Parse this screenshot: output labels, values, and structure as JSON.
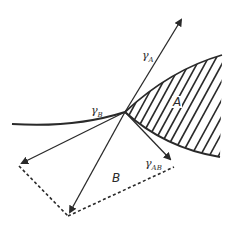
{
  "diagram": {
    "type": "surface-tension-vector-balance",
    "colors": {
      "ink": "#2a2a2a",
      "background": "#ffffff"
    },
    "labels": {
      "gamma_a": {
        "symbol": "γ",
        "sub": "A"
      },
      "gamma_b": {
        "symbol": "γ",
        "sub": "B"
      },
      "gamma_ab": {
        "symbol": "γ",
        "sub": "AB"
      },
      "region_a": "A",
      "region_b": "B"
    },
    "points": {
      "junction": [
        125,
        112
      ],
      "gamma_a_tip": [
        183,
        16
      ],
      "gamma_b_tip": [
        19,
        165
      ],
      "gamma_ab_tip": [
        173,
        162
      ],
      "resultant_tip": [
        68,
        216
      ]
    }
  }
}
